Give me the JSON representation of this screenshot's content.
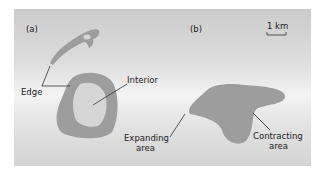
{
  "panels": {
    "a": {
      "label": "(a)",
      "edge": "Edge",
      "interior": "Interior"
    },
    "b": {
      "label": "(b)",
      "expanding": [
        "Expanding",
        "area"
      ],
      "contracting": [
        "Contracting",
        "area"
      ]
    }
  },
  "scale_bar": {
    "label": "1 km"
  },
  "colors": {
    "shape": "#9d9d9d",
    "interior": "#d6d6d6",
    "line": "#333333"
  }
}
